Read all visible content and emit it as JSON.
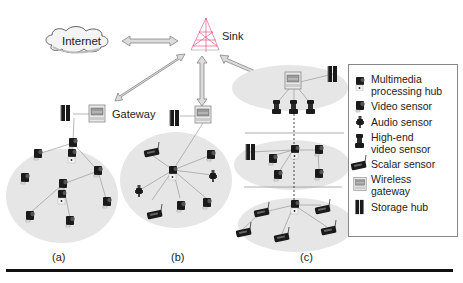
{
  "diagram": {
    "nodes": {
      "internet": "Internet",
      "sink": "Sink",
      "gateway": "Gateway"
    },
    "panels": [
      {
        "id": "a",
        "label": "(a)",
        "description": "single-tier flat, homogeneous sensors, distributed processing"
      },
      {
        "id": "b",
        "label": "(b)",
        "description": "single-tier clustered, heterogeneous sensors, centralized processing"
      },
      {
        "id": "c",
        "label": "(c)",
        "description": "multi-tier, heterogeneous sensors, distributed processing"
      }
    ],
    "edges": [
      {
        "from": "internet",
        "to": "sink",
        "type": "bidirectional-arrow"
      },
      {
        "from": "sink",
        "to": "gateway-a",
        "type": "bidirectional-arrow"
      },
      {
        "from": "sink",
        "to": "gateway-b",
        "type": "bidirectional-arrow"
      },
      {
        "from": "sink",
        "to": "gateway-c",
        "type": "bidirectional-arrow"
      }
    ]
  },
  "legend": {
    "items": [
      {
        "icon": "multimedia-processing-hub-icon",
        "label_line1": "Multimedia",
        "label_line2": "processing hub"
      },
      {
        "icon": "video-sensor-icon",
        "label_line1": "Video sensor",
        "label_line2": ""
      },
      {
        "icon": "audio-sensor-icon",
        "label_line1": "Audio sensor",
        "label_line2": ""
      },
      {
        "icon": "high-end-video-sensor-icon",
        "label_line1": "High-end",
        "label_line2": "video sensor"
      },
      {
        "icon": "scalar-sensor-icon",
        "label_line1": "Scalar sensor",
        "label_line2": ""
      },
      {
        "icon": "wireless-gateway-icon",
        "label_line1": "Wireless",
        "label_line2": "gateway"
      },
      {
        "icon": "storage-hub-icon",
        "label_line1": "Storage hub",
        "label_line2": ""
      }
    ]
  },
  "colors": {
    "cluster_fill": "#e6e6e6",
    "arrow_fill": "#d8d8d8",
    "arrow_stroke": "#777777",
    "line": "#999999",
    "device": "#1a1a1a",
    "rule": "#111111"
  }
}
